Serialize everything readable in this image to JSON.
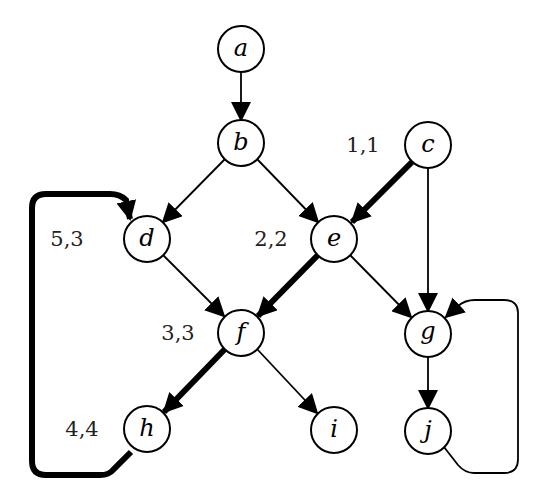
{
  "diagram": {
    "type": "directed-graph",
    "nodes": [
      {
        "id": "a",
        "label": "a",
        "x": 241,
        "y": 49
      },
      {
        "id": "b",
        "label": "b",
        "x": 241,
        "y": 143
      },
      {
        "id": "c",
        "label": "c",
        "x": 428,
        "y": 145
      },
      {
        "id": "d",
        "label": "d",
        "x": 147,
        "y": 239
      },
      {
        "id": "e",
        "label": "e",
        "x": 334,
        "y": 239
      },
      {
        "id": "f",
        "label": "f",
        "x": 241,
        "y": 333
      },
      {
        "id": "g",
        "label": "g",
        "x": 428,
        "y": 334
      },
      {
        "id": "h",
        "label": "h",
        "x": 147,
        "y": 429
      },
      {
        "id": "i",
        "label": "i",
        "x": 334,
        "y": 430
      },
      {
        "id": "j",
        "label": "j",
        "x": 428,
        "y": 431
      }
    ],
    "annotations": [
      {
        "node": "c",
        "text": "1,1",
        "x": 363,
        "y": 145
      },
      {
        "node": "e",
        "text": "2,2",
        "x": 271,
        "y": 239
      },
      {
        "node": "f",
        "text": "3,3",
        "x": 178,
        "y": 333
      },
      {
        "node": "h",
        "text": "4,4",
        "x": 82,
        "y": 429
      },
      {
        "node": "d",
        "text": "5,3",
        "x": 67,
        "y": 239
      }
    ],
    "edges": [
      {
        "from": "a",
        "to": "b",
        "thick": false
      },
      {
        "from": "b",
        "to": "d",
        "thick": false
      },
      {
        "from": "b",
        "to": "e",
        "thick": false
      },
      {
        "from": "c",
        "to": "e",
        "thick": true
      },
      {
        "from": "c",
        "to": "g",
        "thick": false
      },
      {
        "from": "d",
        "to": "f",
        "thick": false
      },
      {
        "from": "e",
        "to": "f",
        "thick": true
      },
      {
        "from": "e",
        "to": "g",
        "thick": false
      },
      {
        "from": "f",
        "to": "h",
        "thick": true
      },
      {
        "from": "f",
        "to": "i",
        "thick": false
      },
      {
        "from": "g",
        "to": "j",
        "thick": false
      },
      {
        "from": "h",
        "to": "d",
        "thick": true
      },
      {
        "from": "j",
        "to": "g",
        "thick": false
      }
    ]
  }
}
